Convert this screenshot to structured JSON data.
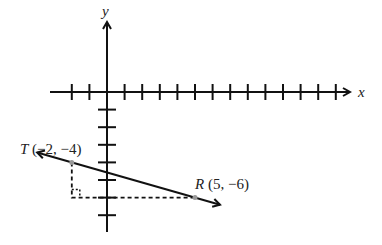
{
  "diagram": {
    "x_axis_label": "x",
    "y_axis_label": "y",
    "origin_px": [
      107,
      92
    ],
    "unit_px": 17.6,
    "x_ticks": [
      -2,
      -1,
      1,
      2,
      3,
      4,
      5,
      6,
      7,
      8,
      9,
      10,
      11,
      12,
      13
    ],
    "y_ticks": [
      -1,
      -2,
      -3,
      -4,
      -5,
      -6,
      -7
    ],
    "points": [
      {
        "name": "T",
        "coords_label": "(−2, −4)",
        "x": -2,
        "y": -4
      },
      {
        "name": "R",
        "coords_label": "(5, −6)",
        "x": 5,
        "y": -6
      }
    ],
    "line": {
      "through": [
        "T",
        "R"
      ],
      "arrows": "both"
    },
    "right_triangle": {
      "vertex": [
        -2,
        -6
      ],
      "dashed": true
    },
    "colors": {
      "ink": "#111111",
      "point": "#999999"
    }
  }
}
